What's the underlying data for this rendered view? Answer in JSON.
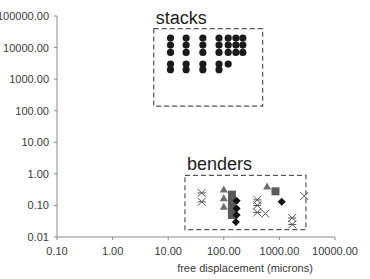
{
  "chart_data": {
    "type": "scatter",
    "title": "",
    "xlabel": "free displacement (microns)",
    "ylabel": "",
    "xscale": "log",
    "yscale": "log",
    "xlim": [
      0.1,
      10000
    ],
    "ylim": [
      0.01,
      100000
    ],
    "grid": false,
    "x_tick_labels": [
      "0.10",
      "1.00",
      "10.00",
      "100.00",
      "1000.00",
      "10000.00"
    ],
    "y_tick_labels": [
      "0.01",
      "0.10",
      "1.00",
      "10.00",
      "100.00",
      "1000.00",
      "10000.00",
      "100000.00"
    ],
    "annotations": [
      {
        "text": "stacks",
        "box": {
          "x": [
            5.5,
            500
          ],
          "y": [
            140,
            40000
          ]
        }
      },
      {
        "text": "benders",
        "box": {
          "x": [
            20,
            3000
          ],
          "y": [
            0.017,
            0.9
          ]
        }
      }
    ],
    "series": [
      {
        "name": "stacks",
        "marker": "circle",
        "color": "#1a1a1a",
        "points": [
          [
            11,
            20000
          ],
          [
            11,
            12000
          ],
          [
            11,
            7000
          ],
          [
            11,
            3000
          ],
          [
            11,
            2000
          ],
          [
            21,
            20000
          ],
          [
            21,
            12000
          ],
          [
            21,
            7000
          ],
          [
            21,
            3000
          ],
          [
            21,
            2000
          ],
          [
            42,
            20000
          ],
          [
            42,
            12000
          ],
          [
            42,
            7000
          ],
          [
            42,
            3000
          ],
          [
            42,
            2000
          ],
          [
            82,
            20000
          ],
          [
            82,
            12000
          ],
          [
            82,
            7000
          ],
          [
            82,
            3000
          ],
          [
            82,
            2000
          ],
          [
            120,
            20000
          ],
          [
            120,
            12000
          ],
          [
            120,
            7000
          ],
          [
            165,
            20000
          ],
          [
            165,
            12000
          ],
          [
            165,
            7000
          ],
          [
            220,
            20000
          ],
          [
            220,
            12000
          ],
          [
            220,
            7000
          ],
          [
            120,
            3000
          ]
        ]
      },
      {
        "name": "benders-triangle",
        "marker": "triangle",
        "color": "#6e6e6e",
        "points": [
          [
            100,
            0.32
          ],
          [
            100,
            0.17
          ],
          [
            100,
            0.09
          ],
          [
            600,
            0.4
          ]
        ]
      },
      {
        "name": "benders-square",
        "marker": "square",
        "color": "#5a5a5a",
        "points": [
          [
            140,
            0.22
          ],
          [
            140,
            0.13
          ],
          [
            140,
            0.08
          ],
          [
            140,
            0.05
          ],
          [
            850,
            0.28
          ]
        ]
      },
      {
        "name": "benders-diamond",
        "marker": "diamond",
        "color": "#111111",
        "points": [
          [
            170,
            0.14
          ],
          [
            170,
            0.08
          ],
          [
            170,
            0.05
          ],
          [
            165,
            0.03
          ],
          [
            1100,
            0.13
          ]
        ]
      },
      {
        "name": "benders-asterisk",
        "marker": "asterisk",
        "color": "#555555",
        "points": [
          [
            40,
            0.25
          ],
          [
            40,
            0.13
          ],
          [
            400,
            0.15
          ],
          [
            400,
            0.1
          ],
          [
            400,
            0.06
          ],
          [
            1700,
            0.04
          ],
          [
            1700,
            0.025
          ]
        ]
      },
      {
        "name": "benders-x",
        "marker": "x",
        "color": "#555555",
        "points": [
          [
            560,
            0.055
          ],
          [
            2800,
            0.2
          ]
        ]
      }
    ]
  }
}
